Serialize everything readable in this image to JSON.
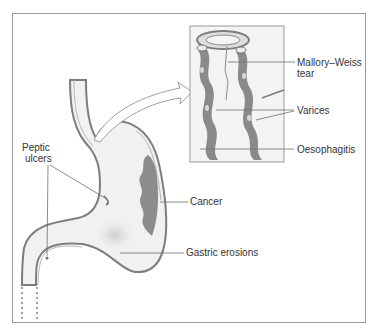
{
  "figure": {
    "colors": {
      "outline": "#7d7d7d",
      "lumen": "#f1f1f1",
      "varix": "#8a8a8a",
      "cancer": "#8c8c8c",
      "frame": "#9a9a9a",
      "text": "#333333"
    }
  },
  "labels": {
    "peptic_ulcers": [
      "Peptic",
      "ulcers"
    ],
    "cancer": "Cancer",
    "gastric_erosions": "Gastric erosions",
    "mallory_weiss": [
      "Mallory–Weiss",
      "tear"
    ],
    "varices": "Varices",
    "oesophagitis": "Oesophagitis"
  }
}
